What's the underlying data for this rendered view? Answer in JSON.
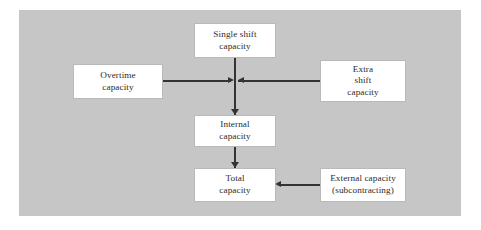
{
  "figure": {
    "panel_color": "#c6c6c6",
    "box_fill": "#ffffff",
    "line_color": "#333333",
    "background": "#ffffff"
  },
  "nodes": {
    "single_shift": {
      "line1": "Single shift",
      "line2": "capacity"
    },
    "overtime": {
      "line1": "Overtime",
      "line2": "capacity"
    },
    "extra_shift": {
      "line1": "Extra",
      "line2": "shift",
      "line3": "capacity"
    },
    "internal": {
      "line1": "Internal",
      "line2": "capacity"
    },
    "total": {
      "line1": "Total",
      "line2": "capacity"
    },
    "external": {
      "line1": "External capacity",
      "line2": "(subcontracting)"
    }
  },
  "connectors": [
    {
      "name": "single-shift-to-internal",
      "direction": "down"
    },
    {
      "name": "overtime-to-junction",
      "direction": "right"
    },
    {
      "name": "extra-shift-to-junction",
      "direction": "left"
    },
    {
      "name": "internal-to-total",
      "direction": "down"
    },
    {
      "name": "external-to-total",
      "direction": "left"
    }
  ]
}
